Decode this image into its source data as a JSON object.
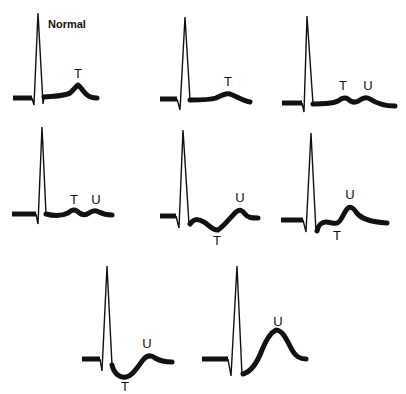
{
  "figure": {
    "header_text": "",
    "panels": [
      {
        "id": 1,
        "title": "Normal",
        "labels": [
          "T"
        ]
      },
      {
        "id": 2,
        "title": "",
        "labels": [
          "T"
        ]
      },
      {
        "id": 3,
        "title": "",
        "labels": [
          "T",
          "U"
        ]
      },
      {
        "id": 4,
        "title": "",
        "labels": [
          "T",
          "U"
        ]
      },
      {
        "id": 5,
        "title": "",
        "labels": [
          "U",
          "T"
        ]
      },
      {
        "id": 6,
        "title": "",
        "labels": [
          "U",
          "T"
        ]
      },
      {
        "id": 7,
        "title": "",
        "labels": [
          "U",
          "T"
        ]
      },
      {
        "id": 8,
        "title": "",
        "labels": [
          "U"
        ]
      }
    ]
  }
}
